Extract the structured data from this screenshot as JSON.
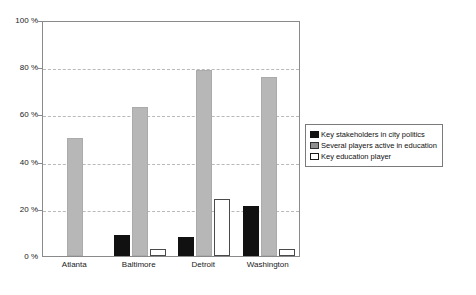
{
  "chart_data": {
    "type": "bar",
    "title": "",
    "subtitle": "",
    "xlabel": "",
    "ylabel": "",
    "categories": [
      "Atlanta",
      "Baltimore",
      "Detroit",
      "Washington"
    ],
    "ylim": [
      0,
      100
    ],
    "y_ticks": [
      "0 %",
      "20 %",
      "40 %",
      "60 %",
      "80 %",
      "100 %"
    ],
    "y_tick_values": [
      0,
      20,
      40,
      60,
      80,
      100
    ],
    "y_unit": "%",
    "grid": "horizontal-dashed",
    "legend_position": "right",
    "series": [
      {
        "name": "Key stakeholders in city politics",
        "color": "#111111",
        "values": [
          0,
          9,
          8,
          21
        ]
      },
      {
        "name": "Several players active in education",
        "color": "#b7b7b7",
        "values": [
          50,
          63,
          79,
          76
        ]
      },
      {
        "name": "Key education player",
        "color": "#ffffff",
        "values": [
          0,
          3,
          24,
          3
        ]
      }
    ]
  },
  "legend": {
    "items": [
      {
        "label": "Key stakeholders in city politics",
        "swatch": "black"
      },
      {
        "label": "Several players active in education",
        "swatch": "gray"
      },
      {
        "label": "Key education player",
        "swatch": "white"
      }
    ]
  }
}
